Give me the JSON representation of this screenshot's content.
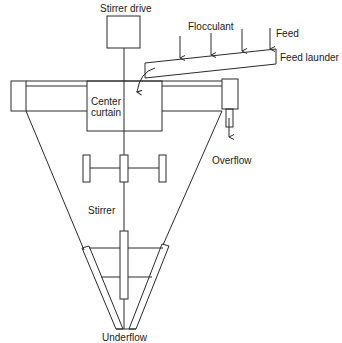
{
  "diagram": {
    "labels": {
      "stirrer_drive": "Stirrer drive",
      "flocculant": "Flocculant",
      "feed": "Feed",
      "feed_launder": "Feed launder",
      "center_curtain_line1": "Center",
      "center_curtain_line2": "curtain",
      "overflow": "Overflow",
      "stirrer": "Stirrer",
      "underflow": "Underflow"
    },
    "colors": {
      "line": "#2a2a2a",
      "background": "#ffffff"
    },
    "components": [
      {
        "id": "stirrer-drive",
        "label": "Stirrer drive"
      },
      {
        "id": "feed-launder",
        "label": "Feed launder",
        "inputs": [
          "Flocculant",
          "Feed"
        ]
      },
      {
        "id": "center-curtain",
        "label": "Center curtain"
      },
      {
        "id": "overflow-outlet",
        "label": "Overflow"
      },
      {
        "id": "stirrer",
        "label": "Stirrer"
      },
      {
        "id": "underflow-outlet",
        "label": "Underflow"
      }
    ]
  }
}
